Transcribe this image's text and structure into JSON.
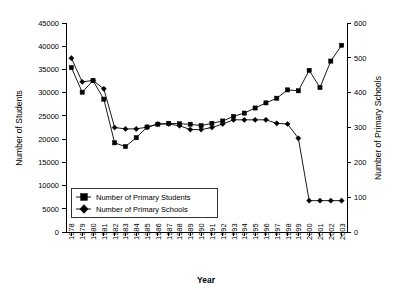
{
  "chart_data": {
    "type": "line",
    "title": "",
    "xlabel": "Year",
    "ylabel": "Number of Students",
    "y2label": "Number of Primary Schools",
    "ylim": [
      0,
      45000
    ],
    "y2lim": [
      0,
      600
    ],
    "ytick_step": 5000,
    "y2tick_step": 100,
    "grid": false,
    "legend_position": "lower-left-inside",
    "categories": [
      "1978",
      "1979",
      "1980",
      "1981",
      "1982",
      "1983",
      "1984",
      "1985",
      "1986",
      "1987",
      "1988",
      "1989",
      "1990",
      "1991",
      "1992",
      "1993",
      "1994",
      "1995",
      "1996",
      "1997",
      "1998",
      "1999",
      "2000",
      "2001",
      "2002",
      "2003"
    ],
    "yticks": [
      "0",
      "5000",
      "10000",
      "15000",
      "20000",
      "25000",
      "30000",
      "35000",
      "40000",
      "45000"
    ],
    "y2ticks": [
      "0",
      "100",
      "200",
      "300",
      "400",
      "500",
      "600"
    ],
    "series": [
      {
        "name": "Number of Primary Students",
        "axis": "left",
        "marker": "square",
        "values": [
          35400,
          30100,
          32600,
          28600,
          19200,
          18400,
          20300,
          22600,
          23200,
          23400,
          23300,
          23200,
          22900,
          23400,
          23900,
          24900,
          25600,
          26700,
          27800,
          28800,
          30600,
          30400,
          34800,
          31100,
          36800,
          40200
        ]
      },
      {
        "name": "Number of Primary Schools",
        "axis": "right",
        "marker": "diamond",
        "values": [
          499,
          431,
          435,
          411,
          300,
          296,
          296,
          301,
          310,
          310,
          305,
          294,
          294,
          300,
          310,
          322,
          322,
          322,
          322,
          312,
          310,
          269,
          90,
          90,
          90,
          90
        ]
      }
    ],
    "legend": [
      {
        "label": "Number of Primary Students",
        "marker": "square"
      },
      {
        "label": "Number of Primary Schools",
        "marker": "diamond"
      }
    ],
    "colors": {
      "series": "#000000",
      "axis": "#000000",
      "background": "#ffffff"
    }
  }
}
